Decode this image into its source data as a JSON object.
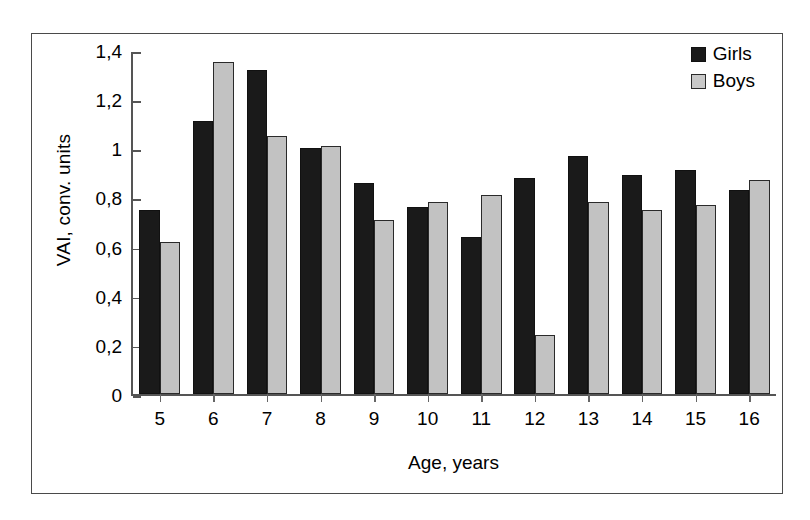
{
  "chart_data": {
    "type": "bar",
    "title": "",
    "xlabel": "Age, years",
    "ylabel": "VAI, conv. units",
    "categories": [
      "5",
      "6",
      "7",
      "8",
      "9",
      "10",
      "11",
      "12",
      "13",
      "14",
      "15",
      "16"
    ],
    "series": [
      {
        "name": "Girls",
        "color": "#1a1a1a",
        "values": [
          0.75,
          1.11,
          1.32,
          1.0,
          0.86,
          0.76,
          0.64,
          0.88,
          0.97,
          0.89,
          0.91,
          0.83
        ]
      },
      {
        "name": "Boys",
        "color": "#c2c2c2",
        "values": [
          0.62,
          1.35,
          1.05,
          1.01,
          0.71,
          0.78,
          0.81,
          0.24,
          0.78,
          0.75,
          0.77,
          0.87
        ]
      }
    ],
    "ylim": [
      0,
      1.4
    ],
    "ytick_values": [
      0,
      0.2,
      0.4,
      0.6,
      0.8,
      1.0,
      1.2,
      1.4
    ],
    "ytick_labels": [
      "0",
      "0,2",
      "0,4",
      "0,6",
      "0,8",
      "1",
      "1,2",
      "1,4"
    ],
    "grid": false,
    "legend_position": "top-right"
  }
}
